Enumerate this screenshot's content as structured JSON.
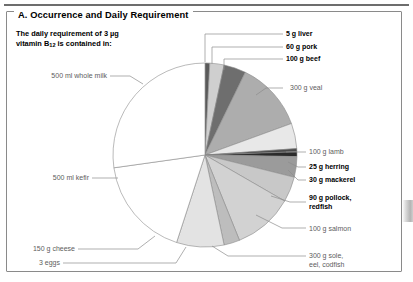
{
  "panel": {
    "title": "A. Occurrence and Daily Requirement",
    "subtitle_line1": "The daily requirement of 3 µg",
    "subtitle_line2_pre": "vitamin B",
    "subtitle_line2_sub": "12",
    "subtitle_line2_post": " is contained in:"
  },
  "chart_data": {
    "type": "pie",
    "title": "A. Occurrence and Daily Requirement",
    "subtitle": "The daily requirement of 3 µg vitamin B12 is contained in:",
    "legend": "none",
    "note": "Wedge size is proportional to the mass of food needed to supply 3 µg vitamin B12; order runs clockwise from 12 o'clock.",
    "categories": [
      "5 g liver",
      "60 g pork",
      "100 g beef",
      "300 g veal",
      "100 g lamb",
      "25 g herring",
      "30 g mackerel",
      "90 g pollock, redfish",
      "100 g salmon",
      "300 g sole, eel, codfish",
      "3 eggs",
      "150 g cheese",
      "500 ml kefir",
      "500 ml whole milk"
    ],
    "values": [
      3,
      9,
      14,
      44,
      16,
      2,
      3,
      13,
      16,
      38,
      10,
      30,
      64,
      98
    ],
    "colors": [
      "#5a5a5a",
      "#cfcfcf",
      "#6e6e6e",
      "#adadad",
      "#e8e8e8",
      "#4a4a4a",
      "#2b2b2b",
      "#9b9b9b",
      "#c8c8c8",
      "#d2d2d2",
      "#bdbdbd",
      "#e3e3e3",
      "#ffffff",
      "#ffffff"
    ],
    "labels_bold": [
      true,
      true,
      true,
      false,
      false,
      true,
      true,
      true,
      false,
      false,
      false,
      false,
      false,
      false
    ]
  },
  "labels": {
    "liver": "5 g liver",
    "pork": "60 g pork",
    "beef": "100 g beef",
    "veal": "300 g veal",
    "lamb": "100 g lamb",
    "herring": "25 g herring",
    "mackerel": "30 g mackerel",
    "pollock_l1": "90 g pollock,",
    "pollock_l2": "redfish",
    "salmon": "100 g salmon",
    "sole_l1": "300 g sole,",
    "sole_l2": "eel, codfish",
    "eggs": "3 eggs",
    "cheese": "150 g cheese",
    "kefir": "500 ml kefir",
    "milk": "500 ml whole milk"
  }
}
